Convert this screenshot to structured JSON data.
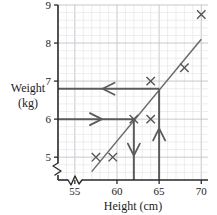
{
  "chart_data": {
    "type": "scatter",
    "title": "",
    "xlabel": "Height (cm)",
    "ylabel": "Weight (kg)",
    "ylabel_line1": "Weight",
    "ylabel_line2": "(kg)",
    "xlim": [
      53.0,
      70.8
    ],
    "ylim": [
      4.4,
      9.0
    ],
    "xticks": [
      55,
      60,
      65,
      70
    ],
    "xtick_labels": [
      "55",
      "60",
      "65",
      "70"
    ],
    "yticks": [
      5,
      6,
      7,
      8,
      9
    ],
    "ytick_labels": [
      "5",
      "6",
      "7",
      "8",
      "9"
    ],
    "grid": true,
    "grid_minor_step_x": 1.0,
    "grid_minor_step_y": 0.2,
    "axis_break_x": true,
    "axis_break_y": true,
    "legend": "none",
    "points": [
      {
        "x": 57.5,
        "y": 5.0
      },
      {
        "x": 59.5,
        "y": 5.0
      },
      {
        "x": 62.0,
        "y": 6.0
      },
      {
        "x": 64.0,
        "y": 6.0
      },
      {
        "x": 64.0,
        "y": 7.0
      },
      {
        "x": 68.0,
        "y": 7.35
      },
      {
        "x": 70.0,
        "y": 8.75
      }
    ],
    "marker": "x",
    "marker_color": "#555555",
    "trendline": {
      "name": "line of best fit",
      "x1": 57.0,
      "y1": 4.62,
      "x2": 70.0,
      "y2": 8.1,
      "color": "#6a6a6a"
    },
    "construction_lines": [
      {
        "name": "read-off-horizontal-upper",
        "orientation": "horizontal",
        "y": 6.8,
        "from_x": 65.0,
        "to_x": 53.0,
        "arrow": "left"
      },
      {
        "name": "read-off-horizontal-lower",
        "orientation": "horizontal",
        "y": 6.0,
        "from_x": 53.0,
        "to_x": 62.0,
        "arrow": "right"
      },
      {
        "name": "read-off-vertical-down",
        "orientation": "vertical",
        "x": 62.0,
        "from_y": 6.0,
        "to_y": 4.4,
        "arrow": "down"
      },
      {
        "name": "read-off-vertical-up",
        "orientation": "vertical",
        "x": 65.0,
        "from_y": 4.4,
        "to_y": 6.8,
        "arrow": "up"
      }
    ],
    "construction_color": "#5b5b5b"
  },
  "axes": {
    "x_title": "Height (cm)",
    "y_title_line1": "Weight",
    "y_title_line2": "(kg)"
  },
  "colors": {
    "axis": "#2a2a2a",
    "grid_minor": "#e2e2e6",
    "grid_major": "#c3c3c8",
    "marker": "#555555",
    "trend": "#6a6a6a",
    "construction": "#5b5b5b",
    "background": "#ffffff"
  }
}
